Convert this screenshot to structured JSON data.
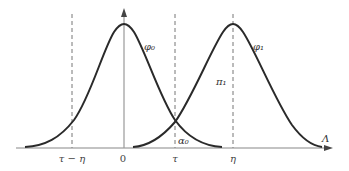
{
  "diagram": {
    "axis": {
      "x_label": "Λ",
      "color": "#888888"
    },
    "ticks": [
      {
        "id": "tau-minus-eta",
        "label": "τ − η",
        "x": 72
      },
      {
        "id": "zero",
        "label": "0",
        "x": 124
      },
      {
        "id": "tau",
        "label": "τ",
        "x": 175
      },
      {
        "id": "eta",
        "label": "η",
        "x": 233
      }
    ],
    "curves": [
      {
        "id": "phi0",
        "label": "φ₀",
        "center_x": 124,
        "peak_y": 24,
        "color": "#2a2a2a"
      },
      {
        "id": "phi1",
        "label": "φ₁",
        "center_x": 233,
        "peak_y": 24,
        "color": "#2a2a2a"
      }
    ],
    "region_labels": [
      {
        "id": "pi1",
        "label": "π₁"
      },
      {
        "id": "alpha0",
        "label": "α₀"
      }
    ],
    "dashed_line_color": "#777777"
  }
}
